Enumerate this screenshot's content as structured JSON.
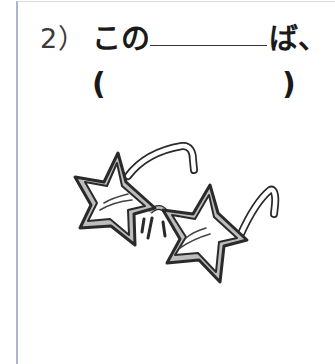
{
  "question": {
    "number": "2）",
    "prefix": "この",
    "blank": "",
    "suffix": "ば、",
    "answer_open": "(",
    "answer_value": "",
    "answer_close": ")"
  },
  "illustration": {
    "subject": "star-shaped glasses",
    "colors": {
      "outline": "#2a2a2a",
      "frame_fill": "#bdbdbd",
      "lens_fill": "#ffffff"
    }
  },
  "page": {
    "border_color": "#aeb2d6"
  }
}
